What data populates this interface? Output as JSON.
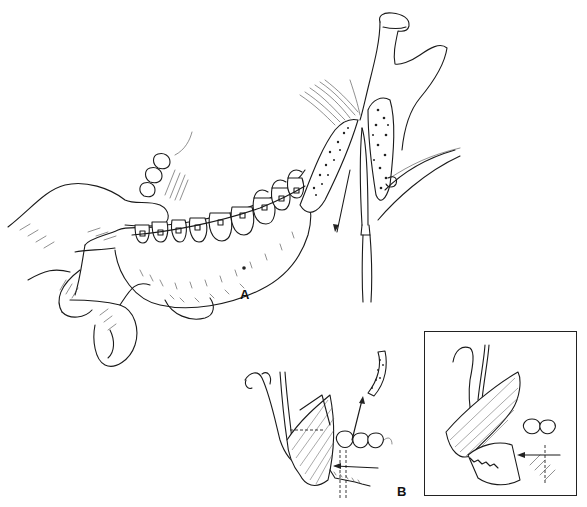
{
  "figure": {
    "panels": [
      {
        "id": "A",
        "label": "A"
      },
      {
        "id": "B",
        "label": "B"
      }
    ],
    "inset": {
      "present": true
    },
    "colors": {
      "line": "#1a1a1a",
      "background": "#ffffff",
      "frame": "#222222"
    }
  }
}
